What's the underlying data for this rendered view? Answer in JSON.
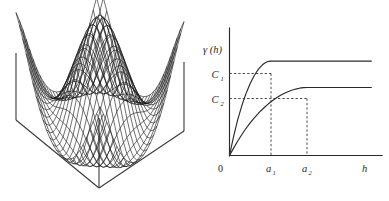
{
  "figure": {
    "panels": [
      {
        "id": "surface-plot",
        "name": "3d-surface-mesh-plot",
        "caption": ""
      },
      {
        "id": "variogram-plot",
        "name": "variogram-model-plot",
        "caption": ""
      }
    ]
  },
  "surface": {
    "description": "wireframe mesh surface on a pedestal box",
    "mesh_color": "#1a1a1a",
    "box_color": "#333333",
    "mesh_rows": 26,
    "mesh_cols": 26
  },
  "chart_data": {
    "type": "line",
    "title": "",
    "xlabel": "h",
    "ylabel": "γ (h)",
    "xlim": [
      0,
      10
    ],
    "ylim": [
      0,
      1.35
    ],
    "grid": false,
    "legend": "none",
    "axis_origin_label": "0",
    "xticks": [
      {
        "value": 0,
        "label": "0"
      },
      {
        "value": 2.7,
        "label": "a",
        "sub": "1"
      },
      {
        "value": 5.1,
        "label": "a",
        "sub": "2"
      }
    ],
    "yticks": [
      {
        "value": 1.0,
        "label": "C",
        "sub": "1"
      },
      {
        "value": 0.72,
        "label": "C",
        "sub": "2"
      }
    ],
    "annotations": [
      {
        "text": "C",
        "sub": "1",
        "type": "sill-label"
      },
      {
        "text": "C",
        "sub": "2",
        "type": "sill-label"
      },
      {
        "text": "a",
        "sub": "1",
        "type": "range-label"
      },
      {
        "text": "a",
        "sub": "2",
        "type": "range-label"
      },
      {
        "text": "h",
        "type": "x-axis-label"
      },
      {
        "text": "γ (h)",
        "type": "y-axis-label"
      },
      {
        "text": "0",
        "type": "origin-label"
      }
    ],
    "series": [
      {
        "name": "model-1",
        "sill": 1.0,
        "range": 2.7,
        "color": "#2a2a2a",
        "x": [
          0,
          0.14,
          0.27,
          0.41,
          0.54,
          0.68,
          0.81,
          0.95,
          1.08,
          1.22,
          1.35,
          1.49,
          1.62,
          1.76,
          1.89,
          2.03,
          2.16,
          2.3,
          2.43,
          2.57,
          2.7,
          3.5,
          4.5,
          5.5,
          6.5,
          7.5,
          8.5,
          9.3
        ],
        "y": [
          0,
          0.105,
          0.203,
          0.294,
          0.379,
          0.457,
          0.529,
          0.595,
          0.655,
          0.71,
          0.76,
          0.805,
          0.845,
          0.881,
          0.912,
          0.938,
          0.96,
          0.977,
          0.99,
          0.997,
          1.0,
          1.0,
          1.0,
          1.0,
          1.0,
          1.0,
          1.0,
          1.0
        ]
      },
      {
        "name": "model-2",
        "sill": 0.72,
        "range": 5.1,
        "color": "#2a2a2a",
        "x": [
          0,
          0.26,
          0.51,
          0.77,
          1.02,
          1.28,
          1.53,
          1.79,
          2.04,
          2.3,
          2.55,
          2.81,
          3.06,
          3.32,
          3.57,
          3.83,
          4.08,
          4.34,
          4.59,
          4.85,
          5.1,
          6.0,
          7.0,
          8.0,
          9.0,
          9.3
        ],
        "y": [
          0,
          0.0755,
          0.1462,
          0.2118,
          0.2729,
          0.3291,
          0.3809,
          0.4285,
          0.4716,
          0.5112,
          0.5472,
          0.5796,
          0.6084,
          0.6343,
          0.6566,
          0.6754,
          0.6912,
          0.7034,
          0.7127,
          0.7181,
          0.72,
          0.72,
          0.72,
          0.72,
          0.72,
          0.72
        ]
      }
    ],
    "guides": [
      {
        "type": "horizontal-dashed",
        "at": 1.0,
        "from_x": 0,
        "to_x": 2.7,
        "name": "sill-1-guide"
      },
      {
        "type": "horizontal-dashed",
        "at": 0.72,
        "from_x": 0,
        "to_x": 5.1,
        "name": "sill-2-guide"
      },
      {
        "type": "vertical-dashed",
        "at": 2.7,
        "from_y": 0,
        "to_y": 1.0,
        "name": "range-1-guide"
      },
      {
        "type": "vertical-dashed",
        "at": 5.1,
        "from_y": 0,
        "to_y": 0.72,
        "name": "range-2-guide"
      }
    ]
  }
}
